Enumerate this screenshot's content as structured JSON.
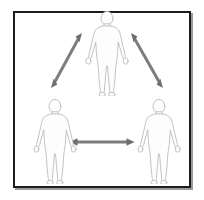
{
  "figure": {
    "panel": {
      "background_color": "#ffffff",
      "border_color": "#1c1c1c",
      "shadow_color": "#9a9a9a",
      "x": 13,
      "y": 11,
      "width": 178,
      "height": 177,
      "border_width": 2
    },
    "palette": {
      "body_fill": "#fdfdfd",
      "body_stroke": "#b9b9b9",
      "body_shade": "#f0f0f0",
      "arrow_color": "#7d7d7d",
      "arrow_color_dark": "#6e6e6e"
    },
    "people": [
      {
        "id": "person-top",
        "label": "top-center figure",
        "cx": 107,
        "cy": 52,
        "scale": 1.0
      },
      {
        "id": "person-bottom-left",
        "label": "bottom-left figure",
        "cx": 55,
        "cy": 140,
        "scale": 1.0
      },
      {
        "id": "person-bottom-right",
        "label": "bottom-right figure",
        "cx": 159,
        "cy": 140,
        "scale": 1.0
      }
    ],
    "arrows": [
      {
        "id": "arrow-top-to-bottom-left",
        "label": "double-headed arrow between top figure and bottom-left figure",
        "x1": 82,
        "y1": 33,
        "x2": 51,
        "y2": 88,
        "double_headed": true,
        "shaft_width": 3,
        "head_size": 7
      },
      {
        "id": "arrow-top-to-bottom-right",
        "label": "double-headed arrow between top figure and bottom-right figure",
        "x1": 131,
        "y1": 33,
        "x2": 163,
        "y2": 88,
        "double_headed": true,
        "shaft_width": 3,
        "head_size": 7
      },
      {
        "id": "arrow-bottom-left-to-bottom-right",
        "label": "double-headed arrow between bottom-left and bottom-right figures",
        "x1": 70,
        "y1": 142,
        "x2": 134,
        "y2": 142,
        "double_headed": true,
        "shaft_width": 3,
        "head_size": 7
      }
    ]
  }
}
